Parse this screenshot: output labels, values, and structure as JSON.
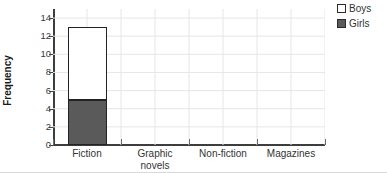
{
  "chart_data": {
    "type": "bar",
    "subtype": "stacked-vertical",
    "title": "",
    "xlabel": "",
    "ylabel": "Frequency",
    "categories": [
      "Fiction",
      "Graphic novels",
      "Non-fiction",
      "Magazines"
    ],
    "series": [
      {
        "name": "Girls",
        "values": [
          5,
          0,
          0,
          0
        ],
        "color": "#5a5a5a"
      },
      {
        "name": "Boys",
        "values": [
          8,
          0,
          0,
          0
        ],
        "color": "#ffffff"
      }
    ],
    "stack_totals": [
      13,
      0,
      0,
      0
    ],
    "ylim": [
      0,
      15
    ],
    "yticks": [
      0,
      2,
      4,
      6,
      8,
      10,
      12,
      14
    ],
    "ytick_labels": [
      "0",
      "2",
      "4",
      "6",
      "8",
      "10",
      "12",
      "14"
    ],
    "grid": true,
    "grid_color": "#e6e6e6",
    "legend_position": "top-right",
    "legend_entries": [
      "Boys",
      "Girls"
    ],
    "axis_color": "#3d3d3d",
    "bar_edge_color": "#232323"
  },
  "axes": {
    "y_title": "Frequency",
    "y_tick_labels": [
      "0",
      "2",
      "4",
      "6",
      "8",
      "10",
      "12",
      "14"
    ],
    "x_tick_labels": [
      {
        "line1": "Fiction",
        "line2": ""
      },
      {
        "line1": "Graphic",
        "line2": "novels"
      },
      {
        "line1": "Non-fiction",
        "line2": ""
      },
      {
        "line1": "Magazines",
        "line2": ""
      }
    ]
  },
  "legend": {
    "items": [
      {
        "label": "Boys",
        "swatch": "#ffffff"
      },
      {
        "label": "Girls",
        "swatch": "#5a5a5a"
      }
    ]
  }
}
